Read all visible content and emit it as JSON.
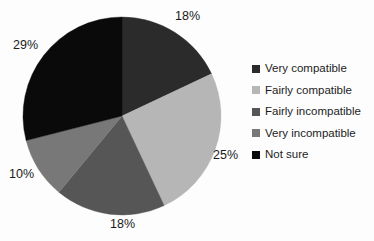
{
  "chart_data": {
    "type": "pie",
    "title": "",
    "xlabel": "",
    "ylabel": "",
    "categories": [
      "Very compatible",
      "Fairly compatible",
      "Fairly incompatible",
      "Very incompatible",
      "Not sure"
    ],
    "values": [
      18,
      25,
      18,
      10,
      29
    ],
    "value_labels": [
      "18%",
      "25%",
      "18%",
      "10%",
      "29%"
    ],
    "colors": [
      "#2b2b2b",
      "#b6b6b6",
      "#565656",
      "#787878",
      "#0a0a0a"
    ],
    "units": "percent",
    "start_angle_deg": 0,
    "direction": "clockwise",
    "legend_position": "right",
    "grid": false,
    "labels_outside": true
  },
  "legend": {
    "items": [
      {
        "label": "Very compatible",
        "color": "#2b2b2b",
        "value": "18%"
      },
      {
        "label": "Fairly compatible",
        "color": "#b6b6b6",
        "value": "25%"
      },
      {
        "label": "Fairly incompatible",
        "color": "#565656",
        "value": "18%"
      },
      {
        "label": "Very incompatible",
        "color": "#787878",
        "value": "10%"
      },
      {
        "label": "Not sure",
        "color": "#0a0a0a",
        "value": "29%"
      }
    ]
  },
  "callouts": {
    "very_compatible": "18%",
    "fairly_compatible": "25%",
    "fairly_incompatible": "18%",
    "very_incompatible": "10%",
    "not_sure": "29%"
  },
  "page": {
    "background": "#fdfdfd",
    "text_color": "#1a1a1a",
    "cropped_title_remnant": ""
  }
}
